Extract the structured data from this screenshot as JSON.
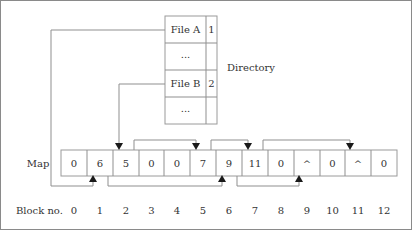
{
  "diagram": {
    "directory": {
      "label": "Directory",
      "rows": [
        {
          "name": "File A",
          "start": "1"
        },
        {
          "name": "...",
          "start": ""
        },
        {
          "name": "File B",
          "start": "2"
        },
        {
          "name": "...",
          "start": ""
        }
      ]
    },
    "map": {
      "label": "Map",
      "cells": [
        "0",
        "6",
        "5",
        "0",
        "0",
        "7",
        "9",
        "11",
        "0",
        "^",
        "0",
        "^",
        "0"
      ]
    },
    "block_numbers": {
      "label": "Block no.",
      "values": [
        "0",
        "1",
        "2",
        "3",
        "4",
        "5",
        "6",
        "7",
        "8",
        "9",
        "10",
        "11",
        "12"
      ]
    },
    "chains": {
      "file_a": [
        1,
        6,
        9
      ],
      "file_b": [
        2,
        5,
        7,
        11
      ]
    }
  }
}
